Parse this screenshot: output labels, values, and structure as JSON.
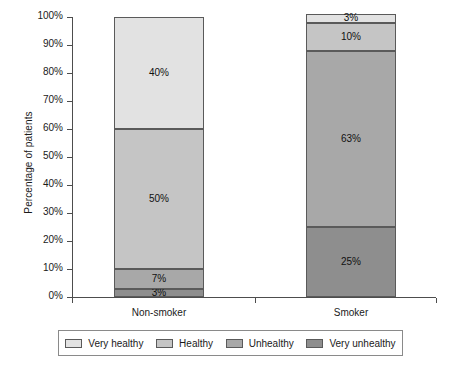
{
  "chart_data": {
    "type": "bar",
    "title": "",
    "subtitle": "",
    "xlabel": "",
    "ylabel": "Percentage of patients",
    "stacked": true,
    "categories": [
      "Non-smoker",
      "Smoker"
    ],
    "ylim": [
      0,
      100
    ],
    "ytick_labels": [
      "0%",
      "10%",
      "20%",
      "30%",
      "40%",
      "50%",
      "60%",
      "70%",
      "80%",
      "90%",
      "100%"
    ],
    "ytick_values": [
      0,
      10,
      20,
      30,
      40,
      50,
      60,
      70,
      80,
      90,
      100
    ],
    "grid": false,
    "legend_position": "bottom",
    "series": [
      {
        "name": "Very healthy",
        "color": "#e2e2e2",
        "values": [
          40,
          3
        ],
        "labels": [
          "40%",
          "3%"
        ]
      },
      {
        "name": "Healthy",
        "color": "#c5c5c5",
        "values": [
          50,
          10
        ],
        "labels": [
          "50%",
          "10%"
        ]
      },
      {
        "name": "Unhealthy",
        "color": "#a8a8a8",
        "values": [
          7,
          63
        ],
        "labels": [
          "7%",
          "63%"
        ]
      },
      {
        "name": "Very unhealthy",
        "color": "#8e8e8e",
        "values": [
          3,
          25
        ],
        "labels": [
          "3%",
          "25%"
        ]
      }
    ]
  },
  "axis": {
    "y_title": "Percentage of patients",
    "ticks": [
      {
        "label": "100%",
        "value": 100
      },
      {
        "label": "90%",
        "value": 90
      },
      {
        "label": "80%",
        "value": 80
      },
      {
        "label": "70%",
        "value": 70
      },
      {
        "label": "60%",
        "value": 60
      },
      {
        "label": "50%",
        "value": 50
      },
      {
        "label": "40%",
        "value": 40
      },
      {
        "label": "30%",
        "value": 30
      },
      {
        "label": "20%",
        "value": 20
      },
      {
        "label": "10%",
        "value": 10
      },
      {
        "label": "0%",
        "value": 0
      }
    ]
  },
  "categories": [
    {
      "label": "Non-smoker"
    },
    {
      "label": "Smoker"
    }
  ],
  "bars": [
    {
      "category": "Non-smoker",
      "segments": [
        {
          "series": "Very healthy",
          "value": 40,
          "label": "40%",
          "color": "#e2e2e2"
        },
        {
          "series": "Healthy",
          "value": 50,
          "label": "50%",
          "color": "#c5c5c5"
        },
        {
          "series": "Unhealthy",
          "value": 7,
          "label": "7%",
          "color": "#a8a8a8"
        },
        {
          "series": "Very unhealthy",
          "value": 3,
          "label": "3%",
          "color": "#8e8e8e"
        }
      ]
    },
    {
      "category": "Smoker",
      "segments": [
        {
          "series": "Very healthy",
          "value": 3,
          "label": "3%",
          "color": "#e2e2e2"
        },
        {
          "series": "Healthy",
          "value": 10,
          "label": "10%",
          "color": "#c5c5c5"
        },
        {
          "series": "Unhealthy",
          "value": 63,
          "label": "63%",
          "color": "#a8a8a8"
        },
        {
          "series": "Very unhealthy",
          "value": 25,
          "label": "25%",
          "color": "#8e8e8e"
        }
      ]
    }
  ],
  "legend": {
    "items": [
      {
        "label": "Very healthy",
        "color": "#e2e2e2"
      },
      {
        "label": "Healthy",
        "color": "#c5c5c5"
      },
      {
        "label": "Unhealthy",
        "color": "#a8a8a8"
      },
      {
        "label": "Very unhealthy",
        "color": "#8e8e8e"
      }
    ]
  }
}
